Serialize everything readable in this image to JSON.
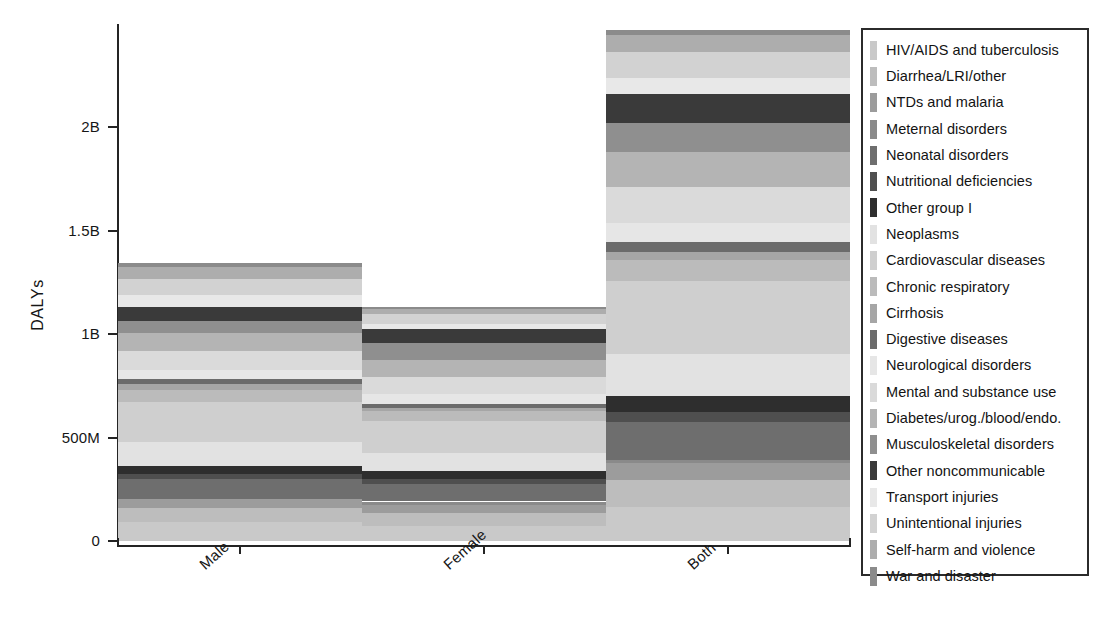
{
  "chart_data": {
    "type": "bar",
    "subtype": "stacked-bar",
    "title": "",
    "xlabel": "",
    "ylabel": "DALYs",
    "categories": [
      "Male",
      "Female",
      "Both"
    ],
    "ylim": [
      0,
      2500000000
    ],
    "grid": false,
    "legend_position": "right-outside",
    "ytick_labels": [
      "0",
      "500M",
      "1B",
      "1.5B",
      "2B"
    ],
    "ytick_values": [
      0,
      500000000,
      1000000000,
      1500000000,
      2000000000
    ],
    "totals": {
      "Male": 1342000000,
      "Female": 1171000000,
      "Both": 2482000000
    },
    "series": [
      {
        "name": "HIV/AIDS and tuberculosis",
        "color": "#c9c9c9",
        "values": [
          92000000,
          74000000,
          166000000
        ]
      },
      {
        "name": "Diarrhea/LRI/other",
        "color": "#bdbdbd",
        "values": [
          69000000,
          61000000,
          130000000
        ]
      },
      {
        "name": "NTDs and malaria",
        "color": "#9c9c9c",
        "values": [
          42000000,
          37000000,
          79000000
        ]
      },
      {
        "name": "Meternal disorders",
        "color": "#8a8a8a",
        "values": [
          0,
          19000000,
          19000000
        ]
      },
      {
        "name": "Neonatal disorders",
        "color": "#6e6e6e",
        "values": [
          99000000,
          83000000,
          182000000
        ]
      },
      {
        "name": "Nutritional deficiencies",
        "color": "#4f4f4f",
        "values": [
          22000000,
          24000000,
          46000000
        ]
      },
      {
        "name": "Other group I",
        "color": "#2e2e2e",
        "values": [
          41000000,
          39000000,
          80000000
        ]
      },
      {
        "name": "Neoplasms",
        "color": "#e2e2e2",
        "values": [
          116000000,
          87000000,
          203000000
        ]
      },
      {
        "name": "Cardiovascular diseases",
        "color": "#cfcfcf",
        "values": [
          193000000,
          158000000,
          351000000
        ]
      },
      {
        "name": "Chronic respiratory",
        "color": "#bbbbbb",
        "values": [
          56000000,
          46000000,
          102000000
        ]
      },
      {
        "name": "Cirrhosis",
        "color": "#a6a6a6",
        "values": [
          28000000,
          13000000,
          41000000
        ]
      },
      {
        "name": "Digestive diseases",
        "color": "#6b6b6b",
        "values": [
          27000000,
          22000000,
          49000000
        ]
      },
      {
        "name": "Neurological disorders",
        "color": "#e6e6e6",
        "values": [
          42000000,
          47000000,
          89000000
        ]
      },
      {
        "name": "Mental and substance use",
        "color": "#dadada",
        "values": [
          92000000,
          82000000,
          174000000
        ]
      },
      {
        "name": "Diabetes/urog./blood/endo.",
        "color": "#b4b4b4",
        "values": [
          86000000,
          85000000,
          171000000
        ]
      },
      {
        "name": "Musculoskeletal disorders",
        "color": "#8f8f8f",
        "values": [
          60000000,
          79000000,
          139000000
        ]
      },
      {
        "name": "Other noncommunicable",
        "color": "#3a3a3a",
        "values": [
          68000000,
          71000000,
          139000000
        ]
      },
      {
        "name": "Transport injuries",
        "color": "#e8e8e8",
        "values": [
          56000000,
          22000000,
          78000000
        ]
      },
      {
        "name": "Unintentional injuries",
        "color": "#d2d2d2",
        "values": [
          78000000,
          48000000,
          126000000
        ]
      },
      {
        "name": "Self-harm and violence",
        "color": "#adadad",
        "values": [
          57000000,
          27000000,
          84000000
        ]
      },
      {
        "name": "War and disaster",
        "color": "#8b8b8b",
        "values": [
          18000000,
          7000000,
          25000000
        ]
      }
    ]
  },
  "axes": {
    "y_title": "DALYs",
    "y_ticks": [
      {
        "label": "2B",
        "value": 2000000000
      },
      {
        "label": "1.5B",
        "value": 1500000000
      },
      {
        "label": "1B",
        "value": 1000000000
      },
      {
        "label": "500M",
        "value": 500000000
      },
      {
        "label": "0",
        "value": 0
      }
    ],
    "x_ticks": [
      "Male",
      "Female",
      "Both"
    ]
  },
  "legend": {
    "items": [
      {
        "label": "HIV/AIDS and tuberculosis",
        "color": "#c9c9c9"
      },
      {
        "label": "Diarrhea/LRI/other",
        "color": "#bdbdbd"
      },
      {
        "label": "NTDs and malaria",
        "color": "#9c9c9c"
      },
      {
        "label": "Meternal disorders",
        "color": "#8a8a8a"
      },
      {
        "label": "Neonatal disorders",
        "color": "#6e6e6e"
      },
      {
        "label": "Nutritional deficiencies",
        "color": "#4f4f4f"
      },
      {
        "label": "Other group I",
        "color": "#2e2e2e"
      },
      {
        "label": "Neoplasms",
        "color": "#e2e2e2"
      },
      {
        "label": "Cardiovascular diseases",
        "color": "#cfcfcf"
      },
      {
        "label": "Chronic respiratory",
        "color": "#bbbbbb"
      },
      {
        "label": "Cirrhosis",
        "color": "#a6a6a6"
      },
      {
        "label": "Digestive diseases",
        "color": "#6b6b6b"
      },
      {
        "label": "Neurological disorders",
        "color": "#e6e6e6"
      },
      {
        "label": "Mental and substance use",
        "color": "#dadada"
      },
      {
        "label": "Diabetes/urog./blood/endo.",
        "color": "#b4b4b4"
      },
      {
        "label": "Musculoskeletal disorders",
        "color": "#8f8f8f"
      },
      {
        "label": "Other noncommunicable",
        "color": "#3a3a3a"
      },
      {
        "label": "Transport injuries",
        "color": "#e8e8e8"
      },
      {
        "label": "Unintentional injuries",
        "color": "#d2d2d2"
      },
      {
        "label": "Self-harm and violence",
        "color": "#adadad"
      },
      {
        "label": "War and disaster",
        "color": "#8b8b8b"
      }
    ]
  }
}
